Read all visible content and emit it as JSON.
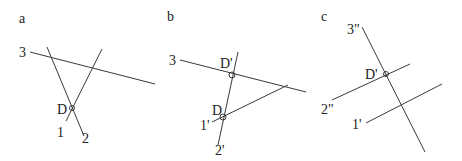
{
  "panels": [
    {
      "label": "a",
      "lines": [
        {
          "name": "3",
          "label": "3"
        },
        {
          "name": "1",
          "label": "1"
        },
        {
          "name": "2",
          "label": "2"
        }
      ],
      "point": {
        "label": "D"
      }
    },
    {
      "label": "b",
      "lines": [
        {
          "name": "3",
          "label": "3"
        },
        {
          "name": "1-prime",
          "label": "1'"
        },
        {
          "name": "2-prime",
          "label": "2'"
        }
      ],
      "points": [
        {
          "label": "D'"
        },
        {
          "label": "D"
        }
      ]
    },
    {
      "label": "c",
      "lines": [
        {
          "name": "3-double-prime",
          "label": "3\""
        },
        {
          "name": "2-double-prime",
          "label": "2\""
        },
        {
          "name": "1-prime",
          "label": "1'"
        }
      ],
      "point": {
        "label": "D'"
      }
    }
  ],
  "colors": {
    "line": "#3a3a3a",
    "text": "#222222",
    "background": "#ffffff"
  }
}
